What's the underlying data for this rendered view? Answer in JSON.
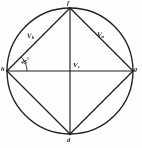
{
  "figure": {
    "type": "geometry-diagram",
    "background_color": "#fefefe",
    "ink_color": "#262626",
    "circle": {
      "center_x": 70,
      "center_y": 71,
      "radius": 63
    },
    "vertices": [
      {
        "id": "top",
        "label": "f",
        "x": 70,
        "y": 8
      },
      {
        "id": "right",
        "label": "g",
        "x": 133,
        "y": 71
      },
      {
        "id": "bottom",
        "label": "d",
        "x": 70,
        "y": 134
      },
      {
        "id": "left",
        "label": "h",
        "x": 7,
        "y": 71
      }
    ],
    "vertex_label_positions": [
      {
        "id": "top",
        "label": "f",
        "left": 67,
        "top": 0
      },
      {
        "id": "right",
        "label": "g",
        "left": 133,
        "top": 66
      },
      {
        "id": "bottom",
        "label": "d",
        "left": 67,
        "top": 137
      },
      {
        "id": "left",
        "label": "h",
        "left": 1,
        "top": 66
      }
    ],
    "chords": [
      {
        "from": "left",
        "to": "top",
        "label": "Vb"
      },
      {
        "from": "top",
        "to": "right",
        "label": "Va"
      },
      {
        "from": "right",
        "to": "bottom",
        "label": ""
      },
      {
        "from": "bottom",
        "to": "left",
        "label": ""
      }
    ],
    "diameters": [
      {
        "id": "horizontal",
        "from_x": 7,
        "from_y": 71,
        "to_x": 133,
        "to_y": 71,
        "label": "Vc"
      },
      {
        "id": "vertical",
        "from_x": 70,
        "from_y": 8,
        "to_x": 70,
        "to_y": 134,
        "label": ""
      }
    ],
    "phasor_labels": [
      {
        "name": "chord-upper-left-label",
        "text_main": "V",
        "text_sub": "b",
        "left": 27,
        "top": 33
      },
      {
        "name": "chord-upper-right-label",
        "text_main": "V",
        "text_sub": "a",
        "left": 97,
        "top": 32
      },
      {
        "name": "horizontal-axis-label",
        "text_main": "V",
        "text_sub": "c",
        "left": 73,
        "top": 62
      }
    ],
    "angle_annotation": {
      "name": "angle-45-label",
      "text": "45",
      "degree_symbol": "°",
      "value_degrees": 45,
      "vertex": "left",
      "arc_radius": 20,
      "left": 21,
      "top": 58
    }
  }
}
